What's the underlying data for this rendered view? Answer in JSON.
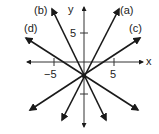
{
  "diagram": {
    "title": "",
    "axes": {
      "x_label": "x",
      "y_label": "y",
      "x_ticks": [
        {
          "value": -5,
          "label": "−5"
        },
        {
          "value": 5,
          "label": "5"
        }
      ],
      "y_ticks": [
        {
          "value": 5,
          "label": "5"
        },
        {
          "value": -5,
          "label": ""
        }
      ]
    },
    "common_point": {
      "x": 0,
      "y": -2
    },
    "lines": [
      {
        "id": "a",
        "label": "(a)",
        "slope_sign": "positive",
        "steep": true
      },
      {
        "id": "b",
        "label": "(b)",
        "slope_sign": "negative",
        "steep": true
      },
      {
        "id": "c",
        "label": "(c)",
        "slope_sign": "positive",
        "steep": false
      },
      {
        "id": "d",
        "label": "(d)",
        "slope_sign": "negative",
        "steep": false
      }
    ],
    "colors": {
      "stroke": "#1a1a1a",
      "axis": "#333333",
      "background": "#ffffff"
    }
  }
}
